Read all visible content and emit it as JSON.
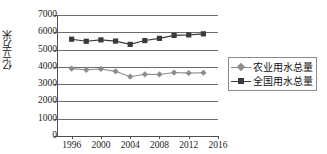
{
  "chart_data": {
    "type": "line",
    "title": "",
    "xlabel": "",
    "ylabel": "亿立方米",
    "x": [
      1996,
      1998,
      2000,
      2002,
      2004,
      2006,
      2008,
      2010,
      2012,
      2014
    ],
    "xlim": [
      1994,
      2016
    ],
    "ylim": [
      0,
      7000
    ],
    "xticks": [
      1996,
      2000,
      2004,
      2008,
      2012,
      2016
    ],
    "xtick_labels": [
      "1996",
      "2000",
      "2004",
      "2008",
      "2012",
      "2016"
    ],
    "yticks": [
      0,
      1000,
      2000,
      3000,
      4000,
      5000,
      6000,
      7000
    ],
    "ytick_labels": [
      "0",
      "1000",
      "2000",
      "3000",
      "4000",
      "5000",
      "6000",
      "7000"
    ],
    "grid": "horizontal",
    "legend_position": "right",
    "series": [
      {
        "name": "农业用水总量",
        "marker": "diamond",
        "color": "#8c8c8c",
        "values": [
          3900,
          3830,
          3880,
          3740,
          3430,
          3570,
          3560,
          3670,
          3640,
          3660
        ]
      },
      {
        "name": "全国用水总量",
        "marker": "square",
        "color": "#3a3a3a",
        "values": [
          5600,
          5480,
          5560,
          5490,
          5300,
          5520,
          5650,
          5820,
          5850,
          5910
        ]
      }
    ]
  },
  "legend": {
    "items": [
      {
        "label": "农业用水总量"
      },
      {
        "label": "全国用水总量"
      }
    ]
  }
}
